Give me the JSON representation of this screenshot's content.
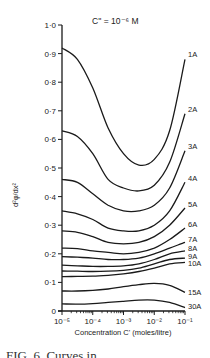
{
  "chart_data": {
    "type": "line",
    "title": "C'' = 10⁻⁶ M",
    "xlabel": "Concentration C' (moles/litre)",
    "ylabel": "d²φ/dx²",
    "x_scale": "log",
    "x": [
      -5,
      -4.5,
      -4,
      -3.5,
      -3,
      -2.5,
      -2,
      -1.5,
      -1
    ],
    "x_note": "x values are log10(C') in moles/litre",
    "xlim": [
      1e-05,
      0.1
    ],
    "ylim": [
      0,
      1.0
    ],
    "x_ticks": [
      "10⁻⁵",
      "10⁻⁴",
      "10⁻³",
      "10⁻²",
      "10⁻¹"
    ],
    "y_ticks": [
      "0",
      "0·1",
      "0·2",
      "0·3",
      "0·4",
      "0·5",
      "0·6",
      "0·7",
      "0·8",
      "0·9",
      "1·0"
    ],
    "grid": false,
    "legend": "inline labels at right end of each curve",
    "series": [
      {
        "name": "1A",
        "values": [
          0.92,
          0.88,
          0.78,
          0.64,
          0.55,
          0.51,
          0.53,
          0.63,
          0.88
        ]
      },
      {
        "name": "2A",
        "values": [
          0.63,
          0.61,
          0.55,
          0.46,
          0.43,
          0.42,
          0.44,
          0.52,
          0.69
        ]
      },
      {
        "name": "3A",
        "values": [
          0.46,
          0.45,
          0.41,
          0.37,
          0.35,
          0.35,
          0.37,
          0.43,
          0.56
        ]
      },
      {
        "name": "4A",
        "values": [
          0.35,
          0.34,
          0.32,
          0.29,
          0.28,
          0.28,
          0.3,
          0.35,
          0.45
        ]
      },
      {
        "name": "5A",
        "values": [
          0.28,
          0.275,
          0.26,
          0.24,
          0.235,
          0.24,
          0.26,
          0.3,
          0.36
        ]
      },
      {
        "name": "6A",
        "values": [
          0.22,
          0.218,
          0.21,
          0.205,
          0.2,
          0.205,
          0.22,
          0.25,
          0.29
        ]
      },
      {
        "name": "7A",
        "values": [
          0.19,
          0.188,
          0.185,
          0.18,
          0.18,
          0.185,
          0.2,
          0.22,
          0.24
        ]
      },
      {
        "name": "8A",
        "values": [
          0.16,
          0.158,
          0.156,
          0.156,
          0.158,
          0.165,
          0.18,
          0.2,
          0.21
        ]
      },
      {
        "name": "9A",
        "values": [
          0.14,
          0.139,
          0.138,
          0.139,
          0.142,
          0.15,
          0.165,
          0.18,
          0.185
        ]
      },
      {
        "name": "10A",
        "values": [
          0.12,
          0.121,
          0.122,
          0.125,
          0.13,
          0.138,
          0.15,
          0.165,
          0.17
        ]
      },
      {
        "name": "15A",
        "values": [
          0.07,
          0.07,
          0.072,
          0.077,
          0.085,
          0.092,
          0.097,
          0.09,
          0.065
        ]
      },
      {
        "name": "30A",
        "values": [
          0.025,
          0.024,
          0.026,
          0.03,
          0.034,
          0.038,
          0.038,
          0.03,
          0.012
        ]
      }
    ]
  },
  "caption": "FIG. 6. Curves in ..."
}
